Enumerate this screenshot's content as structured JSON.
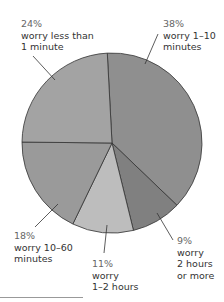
{
  "chart_data": {
    "type": "pie",
    "title": "",
    "center": [
      112,
      143
    ],
    "radius": 90,
    "start_angle_deg": -3,
    "slices": [
      {
        "label": "worry 1–10 minutes",
        "pct_label": "38%",
        "value": 38,
        "color": "#8f8f8f"
      },
      {
        "label": "worry 2 hours or more",
        "pct_label": "9%",
        "value": 9,
        "color": "#808080"
      },
      {
        "label": "worry 1–2 hours",
        "pct_label": "11%",
        "value": 11,
        "color": "#bdbdbd"
      },
      {
        "label": "worry 10–60 minutes",
        "pct_label": "18%",
        "value": 18,
        "color": "#9a9a9a"
      },
      {
        "label": "worry less than 1 minute",
        "pct_label": "24%",
        "value": 24,
        "color": "#a3a3a3"
      }
    ]
  },
  "labels": {
    "l38": {
      "pct": "38%",
      "line1": "worry 1–10",
      "line2": "minutes"
    },
    "l24": {
      "pct": "24%",
      "line1": "worry less than",
      "line2": "1 minute"
    },
    "l18": {
      "pct": "18%",
      "line1": "worry 10–60",
      "line2": "minutes"
    },
    "l11": {
      "pct": "11%",
      "line1": "worry",
      "line2": "1–2 hours"
    },
    "l9": {
      "pct": "9%",
      "line1": "worry",
      "line2": "2 hours",
      "line3": "or more"
    }
  }
}
